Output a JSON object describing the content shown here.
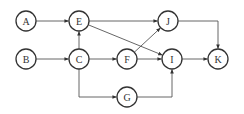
{
  "diagram": {
    "type": "directed-graph",
    "node_radius": 10,
    "colors": {
      "stroke": "#333333",
      "edge": "#555555",
      "background": "#ffffff"
    },
    "nodes": [
      {
        "id": "A",
        "label": "A",
        "x": 26,
        "y": 21
      },
      {
        "id": "B",
        "label": "B",
        "x": 26,
        "y": 59
      },
      {
        "id": "E",
        "label": "E",
        "x": 79,
        "y": 21
      },
      {
        "id": "C",
        "label": "C",
        "x": 79,
        "y": 59
      },
      {
        "id": "F",
        "label": "F",
        "x": 127,
        "y": 59
      },
      {
        "id": "J",
        "label": "J",
        "x": 168,
        "y": 21
      },
      {
        "id": "I",
        "label": "I",
        "x": 172,
        "y": 59
      },
      {
        "id": "K",
        "label": "K",
        "x": 218,
        "y": 59
      },
      {
        "id": "G",
        "label": "G",
        "x": 127,
        "y": 97
      }
    ],
    "edges": [
      {
        "from": "A",
        "to": "E",
        "route": "straight"
      },
      {
        "from": "B",
        "to": "C",
        "route": "straight"
      },
      {
        "from": "C",
        "to": "E",
        "route": "straight"
      },
      {
        "from": "C",
        "to": "F",
        "route": "straight"
      },
      {
        "from": "C",
        "to": "G",
        "route": "down-then-right"
      },
      {
        "from": "E",
        "to": "J",
        "route": "straight"
      },
      {
        "from": "E",
        "to": "I",
        "route": "straight"
      },
      {
        "from": "F",
        "to": "J",
        "route": "straight"
      },
      {
        "from": "F",
        "to": "I",
        "route": "straight"
      },
      {
        "from": "G",
        "to": "I",
        "route": "right-then-up"
      },
      {
        "from": "J",
        "to": "K",
        "route": "right-then-down"
      },
      {
        "from": "I",
        "to": "K",
        "route": "straight"
      }
    ]
  }
}
